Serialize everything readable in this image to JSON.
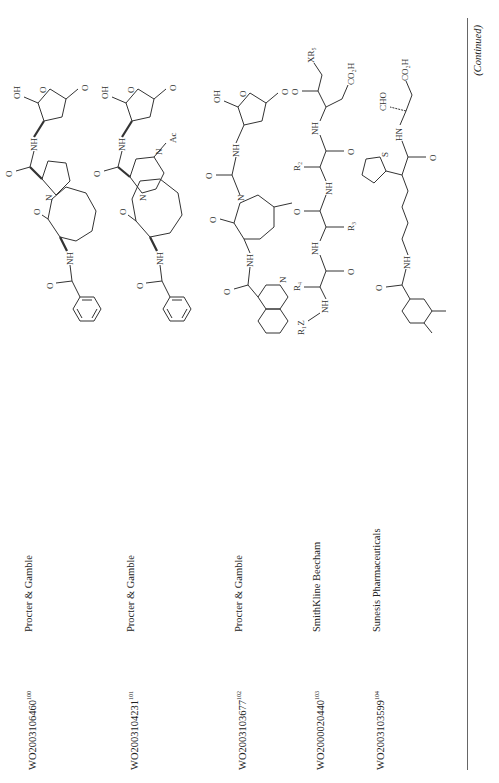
{
  "orientation": "rotated-90-ccw",
  "table": {
    "rows": [
      {
        "patent_number": "WO2003106460",
        "reference": "100",
        "company": "Procter & Gamble",
        "structure": {
          "description": "Bicyclic pyrrolo-azocinone with benzamide and hydroxy-lactone amide",
          "labels": [
            "O",
            "O",
            "OH",
            "NH",
            "N",
            "O",
            "O",
            "NH",
            "O"
          ]
        }
      },
      {
        "patent_number": "WO2003104231",
        "reference": "101",
        "company": "Procter & Gamble",
        "structure": {
          "description": "N-acetyl pyrazino-azocinone with benzamide and hydroxy-lactone amide",
          "labels": [
            "Ac",
            "N",
            "O",
            "O",
            "OH",
            "N",
            "O",
            "NH",
            "O"
          ]
        }
      },
      {
        "patent_number": "WO2003103677",
        "reference": "102",
        "company": "Procter & Gamble",
        "structure": {
          "description": "Methyl-azepinone with isoquinoline-1-carboxamide and hydroxy-lactone acetamide",
          "labels": [
            "O",
            "O",
            "OH",
            "NH",
            "O",
            "N",
            "O",
            "NH",
            "O",
            "N"
          ]
        }
      },
      {
        "patent_number": "WO2000020440",
        "reference": "103",
        "company": "SmithKline Beecham",
        "structure": {
          "description": "Peptidyl ketone R1Z-NH-CH(R4)-CO-NH-CH(R3)-CO-NH-CH(R2)-CO-NH-CH(CH2CO2H)-CO-CH2-XR5",
          "labels": [
            "R1Z",
            "N",
            "H",
            "R4",
            "O",
            "H",
            "N",
            "R3",
            "O",
            "N",
            "H",
            "R2",
            "O",
            "H",
            "N",
            "O",
            "XR5",
            "CO2H"
          ]
        }
      },
      {
        "patent_number": "WO2003103599",
        "reference": "104",
        "company": "Sunesis Pharmaceuticals",
        "structure": {
          "description": "3,4-Dimethylbenzamide pentyl chain to thienyl acetamide of aspartyl aldehyde",
          "labels": [
            "O",
            "NH",
            "S",
            "O",
            "H",
            "N",
            "CHO",
            "CO2H"
          ]
        }
      }
    ]
  },
  "footer": {
    "continued_label": "(Continued)"
  }
}
